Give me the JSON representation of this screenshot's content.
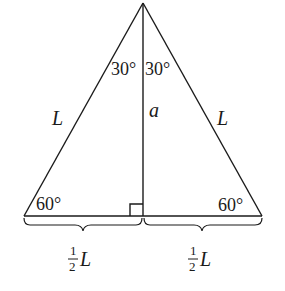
{
  "diagram": {
    "colors": {
      "stroke": "#1a1a1a",
      "background": "#ffffff"
    },
    "angles": {
      "apex_left": "30°",
      "apex_right": "30°",
      "base_left": "60°",
      "base_right": "60°"
    },
    "sides": {
      "left": "L",
      "right": "L",
      "altitude": "a"
    },
    "base_halves": {
      "left": {
        "num": "1",
        "den": "2",
        "var": "L"
      },
      "right": {
        "num": "1",
        "den": "2",
        "var": "L"
      }
    },
    "right_angle_marker": true
  }
}
